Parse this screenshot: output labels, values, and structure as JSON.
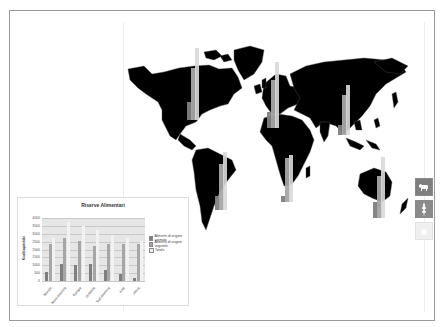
{
  "colors": {
    "map_land": "#000000",
    "map_borders": "#555555",
    "series_animal": "#7f7f7f",
    "series_vegetal": "#a6a6a6",
    "series_total": "#d9d9d9",
    "plot_bg": "#e6e6e6",
    "frame": "#9a9a9a"
  },
  "map": {
    "name": "world-map",
    "region_bars": [
      {
        "region": "Nord America",
        "x": 63,
        "y_base": 98,
        "animal": 18,
        "vegetal": 52,
        "total": 72
      },
      {
        "region": "Europa",
        "x": 143,
        "y_base": 106,
        "animal": 16,
        "vegetal": 48,
        "total": 66
      },
      {
        "region": "Asia",
        "x": 214,
        "y_base": 113,
        "animal": 10,
        "vegetal": 40,
        "total": 50
      },
      {
        "region": "Sud America",
        "x": 91,
        "y_base": 188,
        "animal": 14,
        "vegetal": 46,
        "total": 58
      },
      {
        "region": "Africa",
        "x": 157,
        "y_base": 180,
        "animal": 6,
        "vegetal": 44,
        "total": 47
      },
      {
        "region": "Oceania",
        "x": 249,
        "y_base": 196,
        "animal": 16,
        "vegetal": 42,
        "total": 61
      }
    ]
  },
  "side_icons": [
    {
      "name": "animal-icon",
      "label": "Alimenti di origine animale",
      "active": true
    },
    {
      "name": "plant-icon",
      "label": "Alimenti di origine vegetale",
      "active": true
    },
    {
      "name": "total-icon",
      "label": "Totale",
      "active": false
    }
  ],
  "chart_data": {
    "type": "bar",
    "title": "Riserve Alimentari",
    "xlabel": "",
    "ylabel": "Kcal/capite/die",
    "ylim": [
      0,
      4000
    ],
    "yticks": [
      0,
      500,
      1000,
      1500,
      2000,
      2500,
      3000,
      3500,
      4000
    ],
    "grid": true,
    "legend_position": "right",
    "categories": [
      "Mondo",
      "Nord America",
      "Europa",
      "Oceania",
      "Sud America",
      "Asia",
      "Africa"
    ],
    "series": [
      {
        "name": "Alimenti di origine animale",
        "values": [
          550,
          1050,
          1000,
          1050,
          680,
          430,
          170
        ]
      },
      {
        "name": "Alimenti di origine vegetale",
        "values": [
          2320,
          2730,
          2530,
          2200,
          2320,
          2320,
          2320
        ]
      },
      {
        "name": "Totale",
        "values": [
          2760,
          3760,
          3470,
          3250,
          2940,
          2700,
          2550
        ]
      }
    ]
  }
}
